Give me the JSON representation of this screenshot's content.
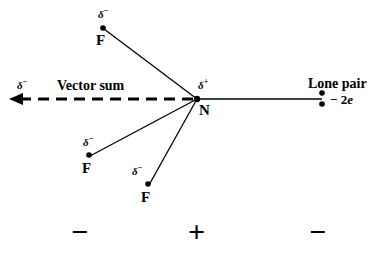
{
  "figure": {
    "background_color": "#ffffff",
    "stroke_color": "#000000",
    "width": 386,
    "height": 257
  },
  "center_atom": {
    "symbol": "N",
    "charge_label": "δ",
    "charge_sign": "+",
    "x": 197,
    "y": 99
  },
  "fluorines": [
    {
      "symbol": "F",
      "charge_label": "δ",
      "charge_sign": "−",
      "x": 103,
      "y": 28
    },
    {
      "symbol": "F",
      "charge_label": "δ",
      "charge_sign": "−",
      "x": 89,
      "y": 155
    },
    {
      "symbol": "F",
      "charge_label": "δ",
      "charge_sign": "−",
      "x": 148,
      "y": 184
    }
  ],
  "lone_pair": {
    "title": "Lone pair",
    "charge_text": "− 2",
    "charge_symbol": "e",
    "dot_top_y": 93,
    "dot_bottom_y": 104,
    "x": 322
  },
  "vector_sum": {
    "label": "Vector sum",
    "charge_label": "δ",
    "charge_sign": "−",
    "arrow_tip_x": 10,
    "arrow_tail_x": 197,
    "arrow_y": 99,
    "style": "dashed"
  },
  "polarity_row": {
    "left": "−",
    "center": "+",
    "right": "−",
    "y": 233,
    "left_x": 80,
    "center_x": 198,
    "right_x": 318
  }
}
